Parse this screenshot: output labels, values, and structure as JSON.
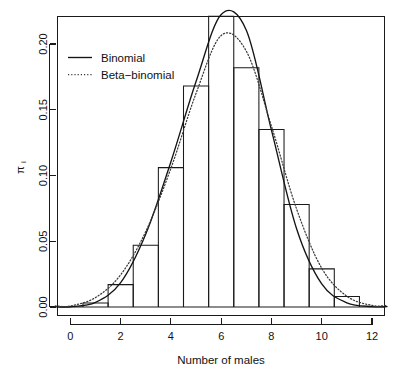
{
  "chart_data": {
    "type": "bar",
    "title": "",
    "subtitle": "",
    "xlabel": "Number of males",
    "ylabel": "πi",
    "xlim": [
      -0.6,
      12.6
    ],
    "ylim": [
      0.0,
      0.2285
    ],
    "grid": false,
    "legend_position": "top-left",
    "categories": [
      0,
      1,
      2,
      3,
      4,
      5,
      6,
      7,
      8,
      9,
      10,
      11,
      12
    ],
    "observed_label": "Observed proportions",
    "values": [
      0.0,
      0.003,
      0.017,
      0.047,
      0.106,
      0.168,
      0.221,
      0.182,
      0.135,
      0.078,
      0.029,
      0.008,
      0.0
    ],
    "xticks": [
      0,
      2,
      4,
      6,
      8,
      10,
      12
    ],
    "xtick_labels": [
      "0",
      "2",
      "4",
      "6",
      "8",
      "10",
      "12"
    ],
    "yticks": [
      0.0,
      0.05,
      0.1,
      0.15,
      0.2
    ],
    "ytick_labels": [
      "0.00",
      "0.05",
      "0.10",
      "0.15",
      "0.20"
    ],
    "series": [
      {
        "name": "Binomial",
        "linestyle": "solid",
        "color": "#141414",
        "x": [
          0,
          1,
          2,
          3,
          4,
          5,
          6,
          7,
          8,
          9,
          10,
          11,
          12
        ],
        "values": [
          0.0002,
          0.0035,
          0.0185,
          0.0555,
          0.1105,
          0.1715,
          0.2225,
          0.2105,
          0.1345,
          0.0595,
          0.0175,
          0.0032,
          0.0003
        ]
      },
      {
        "name": "Beta-binomial",
        "linestyle": "dotted",
        "color": "#3a3a3a",
        "x": [
          0,
          1,
          2,
          3,
          4,
          5,
          6,
          7,
          8,
          9,
          10,
          11,
          12
        ],
        "values": [
          0.0008,
          0.0072,
          0.0245,
          0.0575,
          0.1055,
          0.1625,
          0.2065,
          0.1945,
          0.1375,
          0.0745,
          0.0295,
          0.0082,
          0.0012
        ]
      }
    ]
  },
  "legend": {
    "entries": [
      {
        "label": "Binomial",
        "linestyle": "solid"
      },
      {
        "label": "Beta−binomial",
        "linestyle": "dotted"
      }
    ]
  },
  "axes": {
    "x_title": "Number of males",
    "y_title": "π",
    "y_title_subscript": "i"
  }
}
